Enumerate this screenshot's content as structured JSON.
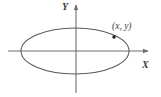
{
  "figure": {
    "background_color": "#ffffff",
    "stroke_color": "#6e6e6e",
    "curve_color": "#5a5a5a",
    "text_color": "#3a3a3a",
    "axes": {
      "origin": {
        "x": 76,
        "y": 51
      },
      "x_axis": {
        "label": "X",
        "start": {
          "x": 8,
          "y": 51
        },
        "end": {
          "x": 148,
          "y": 51
        },
        "arrow": "right"
      },
      "y_axis": {
        "label": "Y",
        "start": {
          "x": 76,
          "y": 93
        },
        "end": {
          "x": 76,
          "y": 5
        },
        "arrow": "up"
      }
    },
    "ellipse": {
      "center_x": 75,
      "center_y": 51,
      "semi_major_axis": 54,
      "semi_minor_axis": 23
    },
    "point": {
      "label": "(x, y)",
      "marker_x": 114,
      "marker_y": 37,
      "marker_radius": 1.7
    }
  }
}
